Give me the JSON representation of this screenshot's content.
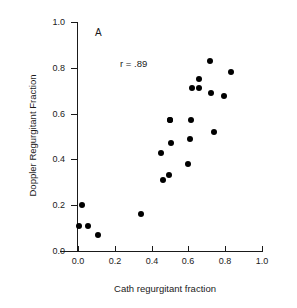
{
  "chart_data": {
    "type": "scatter",
    "title": "",
    "panel_label": "A",
    "annotation": "r = .89",
    "correlation": 0.89,
    "xlabel": "Cath regurgitant fraction",
    "ylabel": "Doppler Regurgitant Fraction",
    "xlim": [
      0.0,
      1.0
    ],
    "ylim": [
      0.0,
      1.0
    ],
    "xticks": [
      "0.0",
      "0.2",
      "0.4",
      "0.6",
      "0.8",
      "1.0"
    ],
    "xtick_values": [
      0.0,
      0.2,
      0.4,
      0.6,
      0.8,
      1.0
    ],
    "yticks": [
      "0.0",
      "0.2",
      "0.4",
      "0.6",
      "0.8",
      "1.0"
    ],
    "ytick_values": [
      0.0,
      0.2,
      0.4,
      0.6,
      0.8,
      1.0
    ],
    "grid": false,
    "legend": false,
    "marker": "filled-circle",
    "marker_color": "#000000",
    "n_points": 22,
    "points": [
      {
        "x": 0.005,
        "y": 0.11
      },
      {
        "x": 0.02,
        "y": 0.2
      },
      {
        "x": 0.055,
        "y": 0.11
      },
      {
        "x": 0.11,
        "y": 0.07
      },
      {
        "x": 0.34,
        "y": 0.16
      },
      {
        "x": 0.45,
        "y": 0.43
      },
      {
        "x": 0.46,
        "y": 0.31
      },
      {
        "x": 0.495,
        "y": 0.33
      },
      {
        "x": 0.5,
        "y": 0.57
      },
      {
        "x": 0.505,
        "y": 0.47
      },
      {
        "x": 0.6,
        "y": 0.38
      },
      {
        "x": 0.61,
        "y": 0.49
      },
      {
        "x": 0.615,
        "y": 0.57
      },
      {
        "x": 0.62,
        "y": 0.71
      },
      {
        "x": 0.655,
        "y": 0.71
      },
      {
        "x": 0.66,
        "y": 0.75
      },
      {
        "x": 0.715,
        "y": 0.83
      },
      {
        "x": 0.725,
        "y": 0.69
      },
      {
        "x": 0.74,
        "y": 0.52
      },
      {
        "x": 0.795,
        "y": 0.675
      },
      {
        "x": 0.83,
        "y": 0.78
      },
      {
        "x": 0.5,
        "y": 0.57
      }
    ]
  }
}
